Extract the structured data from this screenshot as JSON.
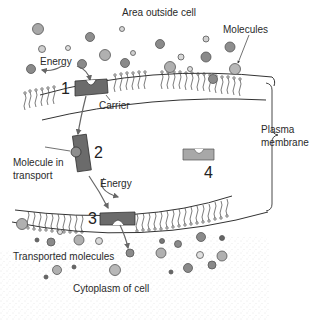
{
  "labels": {
    "outside": "Area outside cell",
    "molecules": "Molecules",
    "energy_top": "Energy",
    "carrier": "Carrier",
    "plasma_membrane_line1": "Plasma",
    "plasma_membrane_line2": "membrane",
    "molecule_in_transport_line1": "Molecule in",
    "molecule_in_transport_line2": "transport",
    "energy_middle": "Energy",
    "transported_molecules": "Transported molecules",
    "cytoplasm": "Cytoplasm of cell"
  },
  "steps": {
    "step1": "1",
    "step2": "2",
    "step3": "3",
    "step4": "4"
  },
  "colors": {
    "carrier": "#6b6b6b",
    "carrier_light": "#a8a8a8",
    "molecule_dark": "#8a8a8a",
    "molecule_light": "#c8c8c8",
    "line": "#333333",
    "cytoplasm_dots": "#bdbdbd"
  }
}
